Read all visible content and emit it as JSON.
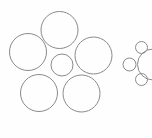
{
  "figure": {
    "name": "ebbinghaus-circles",
    "width": 152,
    "height": 138,
    "background_color": "#fefefe",
    "stroke_color": "#8a8a8a",
    "stroke_width": 1,
    "fill": "none"
  },
  "clusters": [
    {
      "id": "left-cluster",
      "label": "small-center-surrounded-by-large",
      "center_circle": {
        "name": "center-circle-small",
        "cx": 62,
        "cy": 65,
        "r": 11.0
      },
      "surrounding_circles": [
        {
          "name": "surround-circle-top",
          "cx": 59.5,
          "cy": 30.0,
          "r": 18.5
        },
        {
          "name": "surround-circle-left",
          "cx": 28.0,
          "cy": 52.0,
          "r": 18.5
        },
        {
          "name": "surround-circle-right",
          "cx": 93.5,
          "cy": 55.5,
          "r": 18.5
        },
        {
          "name": "surround-circle-bottom-left",
          "cx": 39.0,
          "cy": 93.0,
          "r": 18.5
        },
        {
          "name": "surround-circle-bottom-right",
          "cx": 81.5,
          "cy": 93.5,
          "r": 18.5
        }
      ]
    },
    {
      "id": "right-cluster",
      "label": "large-center-surrounded-by-small",
      "center_circle": {
        "name": "center-circle-large",
        "cx": 153.0,
        "cy": 64.5,
        "r": 15.5
      },
      "surrounding_circles": [
        {
          "name": "surround-dot-top",
          "cx": 141.5,
          "cy": 47.5,
          "r": 6.0
        },
        {
          "name": "surround-dot-left",
          "cx": 129.5,
          "cy": 64.5,
          "r": 6.5
        },
        {
          "name": "surround-dot-bottom",
          "cx": 141.5,
          "cy": 79.5,
          "r": 6.0
        }
      ]
    }
  ]
}
